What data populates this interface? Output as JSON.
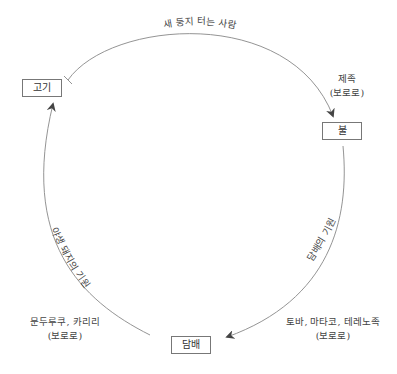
{
  "diagram": {
    "type": "cycle",
    "colors": {
      "line": "#888888",
      "arrowhead": "#444444",
      "node_border": "#777777",
      "text": "#444444"
    },
    "nodes": [
      {
        "id": "meat",
        "label": "고기"
      },
      {
        "id": "fire",
        "label": "불"
      },
      {
        "id": "tobacco",
        "label": "담배"
      }
    ],
    "edges": [
      {
        "from": "fire",
        "to": "meat",
        "direction_drawn": "meat-to-fire arrow with bar-end at 고기",
        "arc_label": "새 둥지 터는 사람",
        "side_label_line1": "제족",
        "side_label_line2": "(보로로)"
      },
      {
        "from": "fire",
        "to": "tobacco",
        "arc_label": "담배의 기원",
        "side_label_line1": "토바, 마타코, 테레노족",
        "side_label_line2": "(보로로)"
      },
      {
        "from": "tobacco",
        "to": "meat",
        "arc_label": "야생 돼지의 기원",
        "side_label_line1": "문두루쿠, 카리리",
        "side_label_line2": "(보로로)"
      }
    ]
  }
}
